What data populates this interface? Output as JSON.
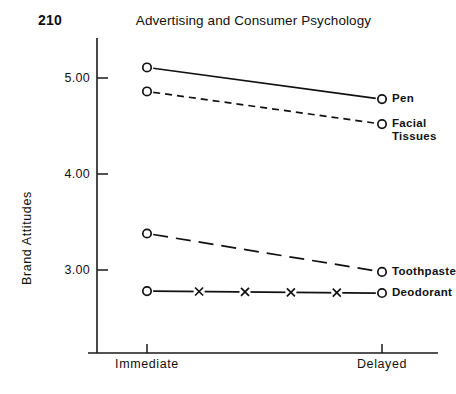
{
  "page": {
    "number": "210",
    "title": "Advertising and Consumer Psychology"
  },
  "chart_data": {
    "type": "line",
    "title": "Advertising and Consumer Psychology",
    "xlabel": "",
    "ylabel": "Brand Attitudes",
    "categories": [
      "Immediate",
      "Delayed"
    ],
    "xticklabels": [
      "Immediate",
      "Delayed"
    ],
    "yticklabels": [
      "5.00",
      "4.00",
      "3.00"
    ],
    "yticks": [
      5.0,
      4.0,
      3.0
    ],
    "ylim": [
      2.4,
      5.45
    ],
    "grid": false,
    "legend_position": "right-inline-labels",
    "series": [
      {
        "name": "Pen",
        "label": "Pen",
        "values": [
          5.11,
          4.78
        ],
        "linestyle": "solid",
        "marker": "open-circle"
      },
      {
        "name": "Facial Tissues",
        "label": "Facial\nTissues",
        "values": [
          4.86,
          4.52
        ],
        "linestyle": "dashed",
        "marker": "open-circle"
      },
      {
        "name": "Toothpaste",
        "label": "Toothpaste",
        "values": [
          3.38,
          2.98
        ],
        "linestyle": "long-dash",
        "marker": "open-circle"
      },
      {
        "name": "Deodorant",
        "label": "Deodorant",
        "values": [
          2.78,
          2.76
        ],
        "linestyle": "solid-with-x",
        "marker": "open-circle-and-x"
      }
    ]
  },
  "axes": {
    "y_title": "Brand Attitudes"
  },
  "colors": {
    "ink": "#111111",
    "background": "#ffffff"
  }
}
